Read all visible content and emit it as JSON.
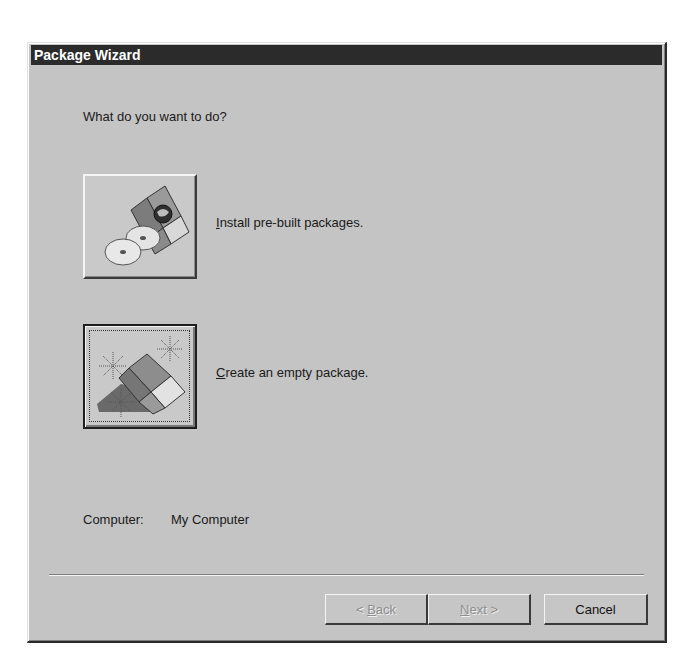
{
  "window": {
    "title": "Package Wizard"
  },
  "prompt": "What do you want to do?",
  "options": [
    {
      "icon": "box-with-cds-icon",
      "label_mnemonic": "I",
      "label_rest": "nstall pre-built packages.",
      "focused": false
    },
    {
      "icon": "new-box-sparkle-icon",
      "label_mnemonic": "C",
      "label_rest": "reate an empty package.",
      "focused": true
    }
  ],
  "computer": {
    "label": "Computer:",
    "value": "My Computer"
  },
  "buttons": {
    "back": {
      "prefix": "< ",
      "mnemonic": "B",
      "rest": "ack",
      "enabled": false
    },
    "next": {
      "prefix": "",
      "mnemonic": "N",
      "rest": "ext >",
      "enabled": false
    },
    "cancel": {
      "label": "Cancel",
      "enabled": true
    }
  },
  "colors": {
    "titlebar_bg": "#2b2b2b",
    "dialog_bg": "#c4c4c4",
    "disabled_text": "#8e8e8e"
  }
}
